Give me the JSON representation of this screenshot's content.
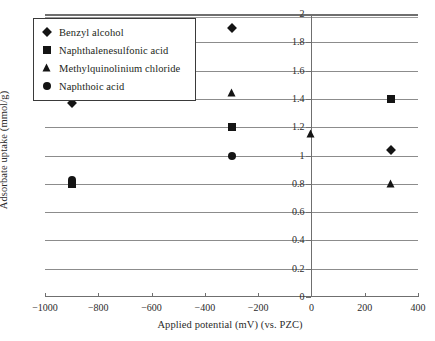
{
  "chart_data": {
    "type": "scatter",
    "title": "",
    "xlabel": "Applied potential (mV) (vs. PZC)",
    "ylabel": "Adsorbate uptake (mmol/g)",
    "xlim": [
      -1000,
      400
    ],
    "ylim": [
      0,
      2
    ],
    "xticks": [
      -1000,
      -800,
      -600,
      -400,
      -200,
      0,
      200,
      400
    ],
    "yticks": [
      0,
      0.2,
      0.4,
      0.6,
      0.8,
      1,
      1.2,
      1.4,
      1.6,
      1.8,
      2
    ],
    "xtick_labels": [
      "-1000",
      "-800",
      "-600",
      "-400",
      "-200",
      "0",
      "200",
      "400"
    ],
    "ytick_labels": [
      "0",
      "0.2",
      "0.4",
      "0.6",
      "0.8",
      "1",
      "1.2",
      "1.4",
      "1.6",
      "1.8",
      "2"
    ],
    "grid": "horizontal",
    "legend_position": "top-left",
    "marker_color": "#141414",
    "series": [
      {
        "name": "Benzyl alcohol",
        "marker": "diamond",
        "points": [
          {
            "x": -900,
            "y": 1.37
          },
          {
            "x": -300,
            "y": 1.9
          },
          {
            "x": 300,
            "y": 1.04
          }
        ]
      },
      {
        "name": "Naphthalenesulfonic acid",
        "marker": "square",
        "points": [
          {
            "x": -900,
            "y": 0.8
          },
          {
            "x": -300,
            "y": 1.2
          },
          {
            "x": 300,
            "y": 1.4
          }
        ]
      },
      {
        "name": "Methylquinolinium chloride",
        "marker": "triangle",
        "points": [
          {
            "x": -300,
            "y": 1.44
          },
          {
            "x": 0,
            "y": 1.15
          },
          {
            "x": 300,
            "y": 0.8
          }
        ]
      },
      {
        "name": "Naphthoic acid",
        "marker": "circle",
        "points": [
          {
            "x": -900,
            "y": 0.83
          },
          {
            "x": -300,
            "y": 1.0
          }
        ]
      }
    ]
  }
}
